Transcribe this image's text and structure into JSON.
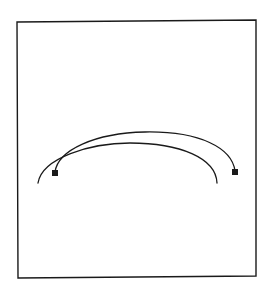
{
  "diagram": {
    "background": "#ffffff",
    "stroke_color": "#1a1a1a",
    "frame": {
      "points": "17,22 256,20 256,276 18,278",
      "stroke_width": 1.4
    },
    "curves": [
      {
        "name": "outer-arc",
        "d": "M 55,172 C 58,150 95,133 145,132 C 200,131 232,148 235,171",
        "stroke_width": 1.3
      },
      {
        "name": "inner-arc",
        "d": "M 38,183 C 42,158 90,143 130,143 C 180,143 216,158 217,183",
        "stroke_width": 1.3
      }
    ],
    "markers": [
      {
        "name": "left-square-marker",
        "cx": 55,
        "cy": 173,
        "size": 6
      },
      {
        "name": "right-square-marker",
        "cx": 235,
        "cy": 172,
        "size": 6
      }
    ]
  }
}
